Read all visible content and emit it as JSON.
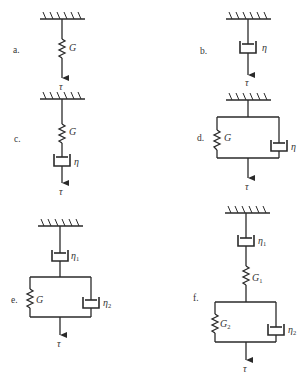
{
  "figure": {
    "panels": [
      {
        "id": "a",
        "label": "a.",
        "elements": [
          "spring"
        ],
        "spring_label": "G",
        "force_label": "τ"
      },
      {
        "id": "b",
        "label": "b.",
        "elements": [
          "dashpot"
        ],
        "dashpot_label": "η",
        "force_label": "τ"
      },
      {
        "id": "c",
        "label": "c.",
        "elements": [
          "spring",
          "dashpot"
        ],
        "spring_label": "G",
        "dashpot_label": "η",
        "force_label": "τ"
      },
      {
        "id": "d",
        "label": "d.",
        "elements": [
          "parallel(spring, dashpot)"
        ],
        "spring_label": "G",
        "dashpot_label": "η",
        "force_label": "τ"
      },
      {
        "id": "e",
        "label": "e.",
        "elements": [
          "dashpot",
          "parallel(spring, dashpot)"
        ],
        "dashpot1_label": "η",
        "dashpot1_sub": "1",
        "spring_label": "G",
        "dashpot2_label": "η",
        "dashpot2_sub": "2",
        "force_label": "τ"
      },
      {
        "id": "f",
        "label": "f.",
        "elements": [
          "dashpot",
          "spring",
          "parallel(spring, dashpot)"
        ],
        "dashpot1_label": "η",
        "dashpot1_sub": "1",
        "spring1_label": "G",
        "spring1_sub": "1",
        "spring2_label": "G",
        "spring2_sub": "2",
        "dashpot2_label": "η",
        "dashpot2_sub": "2",
        "force_label": "τ"
      }
    ]
  }
}
